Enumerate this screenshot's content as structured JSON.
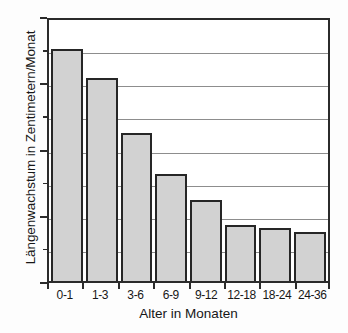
{
  "chart_data": {
    "type": "bar",
    "title": "",
    "xlabel": "Alter in Monaten",
    "ylabel": "Längenwachstum in Zentimetern/Monat",
    "categories": [
      "0-1",
      "1-3",
      "3-6",
      "6-9",
      "9-12",
      "12-18",
      "18-24",
      "24-36"
    ],
    "values": [
      3.5,
      3.07,
      2.24,
      1.62,
      1.23,
      0.85,
      0.8,
      0.74
    ],
    "ylim": [
      0,
      4
    ],
    "ytick_labels": [
      "0",
      "1",
      "2",
      "3",
      "4"
    ],
    "ytick_values": [
      0,
      1,
      2,
      3,
      4
    ],
    "yminor_values": [
      0.5,
      1.5,
      2.5,
      3.5
    ],
    "gridline_values": [
      0.5,
      1.0,
      1.5,
      2.0,
      2.5,
      3.0,
      3.5
    ],
    "grid": true,
    "legend": "none",
    "colors": {
      "bar_fill": "#d2d2d2",
      "bar_edge": "#262626",
      "axis": "#2b2b2b",
      "grid": "#8d8d8d",
      "text": "#171717",
      "background": "#ffffff"
    }
  }
}
